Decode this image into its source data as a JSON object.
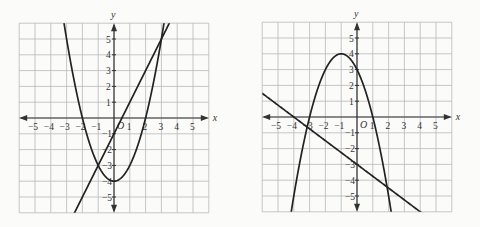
{
  "chart_data": [
    {
      "type": "line",
      "title": "",
      "xlabel": "x",
      "ylabel": "y",
      "origin_label": "O",
      "xlim": [
        -6,
        6
      ],
      "ylim": [
        -6,
        6
      ],
      "grid": true,
      "x_ticks": [
        "-5",
        "-4",
        "-3",
        "-2",
        "-1",
        "1",
        "2",
        "3",
        "4",
        "5"
      ],
      "y_ticks": [
        "5",
        "4",
        "3",
        "2",
        "1",
        "-1",
        "-2",
        "-3",
        "-4",
        "-5"
      ],
      "series": [
        {
          "name": "parabola",
          "equation": "y = x^2 - 4",
          "vertex": [
            0,
            -4
          ],
          "x_intercepts": [
            -2,
            2
          ]
        },
        {
          "name": "line",
          "equation": "y = 2x - 1",
          "y_intercept": -1,
          "slope": 2
        }
      ],
      "intersections": [
        [
          -1,
          -3
        ],
        [
          3,
          5
        ]
      ]
    },
    {
      "type": "line",
      "title": "",
      "xlabel": "x",
      "ylabel": "y",
      "origin_label": "O",
      "xlim": [
        -6,
        6
      ],
      "ylim": [
        -6,
        6
      ],
      "grid": true,
      "x_ticks": [
        "-5",
        "-4",
        "-3",
        "-2",
        "-1",
        "1",
        "2",
        "3",
        "4",
        "5"
      ],
      "y_ticks": [
        "5",
        "4",
        "3",
        "2",
        "1",
        "-1",
        "-2",
        "-3",
        "-4",
        "-5"
      ],
      "series": [
        {
          "name": "parabola",
          "equation": "y = -(x+1)^2 + 4",
          "vertex": [
            -1,
            4
          ],
          "x_intercepts": [
            -3,
            1
          ],
          "y_intercept": 3
        },
        {
          "name": "line",
          "equation": "y = -0.75x - 3",
          "y_intercept": -3,
          "x_intercept": -4
        }
      ],
      "intersections": [
        [
          -3,
          -0.75
        ],
        [
          1.75,
          -4.3
        ]
      ]
    }
  ],
  "graphs": [
    {
      "x_label": "x",
      "y_label": "y",
      "origin": "O"
    },
    {
      "x_label": "x",
      "y_label": "y",
      "origin": "O"
    }
  ]
}
